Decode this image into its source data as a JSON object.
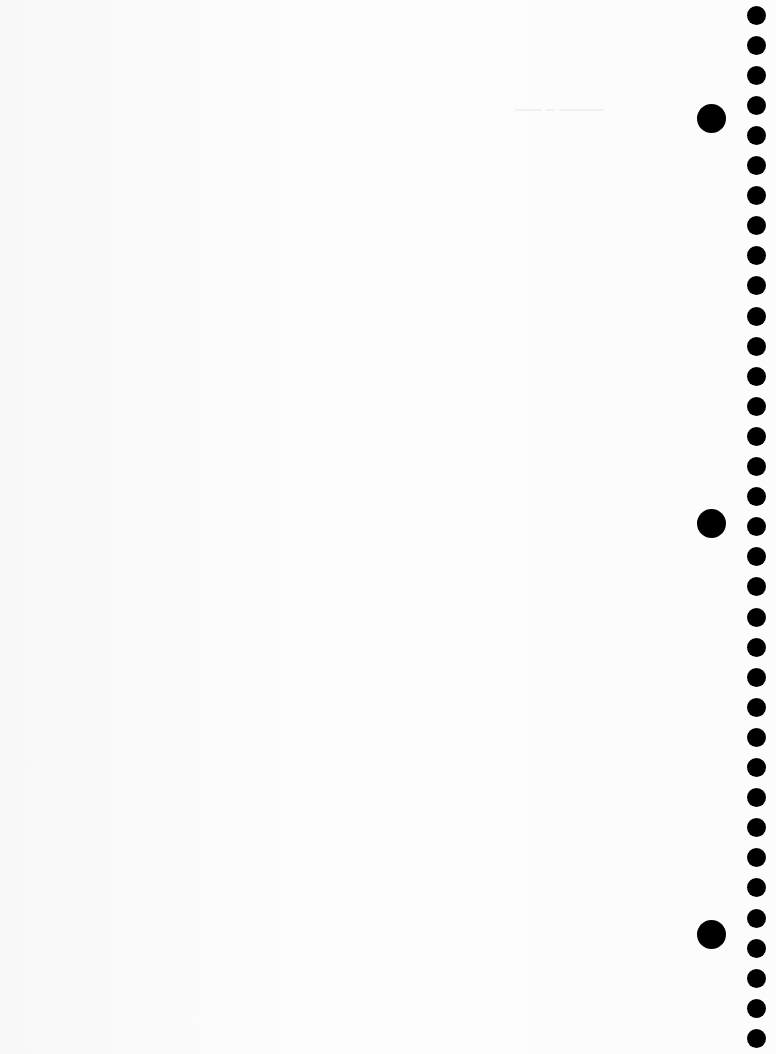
{
  "page": {
    "type": "blank-notebook-paper",
    "background_color": "#fbfbfb",
    "hole_color": "#000000"
  },
  "small_holes": {
    "count": 35,
    "x_center": 756,
    "first_y": 15,
    "spacing": 30.1,
    "diameter": 19
  },
  "large_holes": [
    {
      "x_center": 711,
      "y_center": 118,
      "diameter": 29
    },
    {
      "x_center": 711,
      "y_center": 523,
      "diameter": 29
    },
    {
      "x_center": 711,
      "y_center": 934,
      "diameter": 29
    }
  ]
}
